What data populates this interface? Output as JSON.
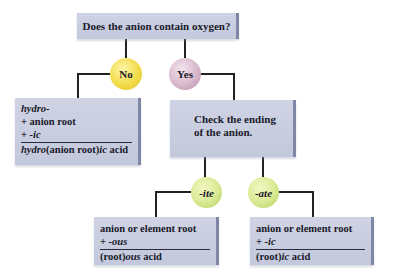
{
  "question": "Does the anion contain oxygen?",
  "branches": {
    "no": {
      "label": "No",
      "color": "#f3dc4a",
      "rule": {
        "line1": "hydro-",
        "line2": "+ anion root",
        "line3_prefix": "+ ",
        "line3_suffix": "-ic",
        "result_prefix": "hydro",
        "result_mid": "(anion root)",
        "result_suffix": "ic",
        "result_tail": " acid"
      }
    },
    "yes": {
      "label": "Yes",
      "color": "#d9b8cc",
      "step": "Check the ending of the anion.",
      "step_line1": "Check the ending",
      "step_line2": "of the anion."
    }
  },
  "endings": [
    {
      "label": "-ite",
      "color": "#d8e991",
      "rule": {
        "line1": "anion or element root",
        "line2_prefix": "+ ",
        "line2_suffix": "-ous",
        "result_prefix": "(root)",
        "result_suffix": "ous",
        "result_tail": " acid"
      }
    },
    {
      "label": "-ate",
      "color": "#d8e991",
      "rule": {
        "line1": "anion or element root",
        "line2_prefix": "+ ",
        "line2_suffix": "-ic",
        "result_prefix": "(root)",
        "result_suffix": "ic",
        "result_tail": " acid"
      }
    }
  ]
}
